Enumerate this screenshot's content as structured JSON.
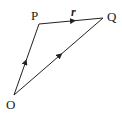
{
  "diagram": {
    "type": "vector-triangle",
    "points": {
      "O": {
        "label": "O",
        "x": 14,
        "y": 95
      },
      "P": {
        "label": "P",
        "x": 39,
        "y": 24
      },
      "Q": {
        "label": "Q",
        "x": 103,
        "y": 18
      }
    },
    "edges": [
      {
        "from": "O",
        "to": "P",
        "arrow": "midpoint"
      },
      {
        "from": "P",
        "to": "Q",
        "arrow": "midpoint",
        "label": "r"
      },
      {
        "from": "O",
        "to": "Q",
        "arrow": "midpoint"
      }
    ],
    "labels": {
      "O": "O",
      "P": "P",
      "Q": "Q",
      "r": "r"
    },
    "colors": {
      "line": "#222222",
      "background": "#ffffff"
    }
  }
}
